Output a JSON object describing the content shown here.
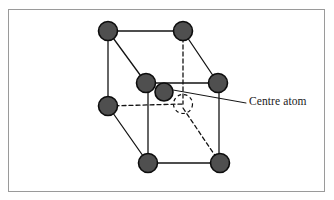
{
  "figure": {
    "frame": {
      "x": 8,
      "y": 9,
      "width": 317,
      "height": 183,
      "border_color": "#9a9a9a",
      "background": "#ffffff"
    },
    "colors": {
      "atom_fill": "#4f4f4f",
      "atom_stroke": "#0d0d0d",
      "edge_solid": "#141414",
      "edge_hidden": "#141414",
      "label_color": "#1a1a1a",
      "leader_color": "#141414"
    },
    "atoms": [
      {
        "id": "back-top-left",
        "name": "corner atom back top left",
        "cx": 108,
        "cy": 31,
        "r": 9.5,
        "style": "filled"
      },
      {
        "id": "back-top-right",
        "name": "corner atom back top right",
        "cx": 183,
        "cy": 31,
        "r": 9.5,
        "style": "filled"
      },
      {
        "id": "front-top-left",
        "name": "corner atom front top left",
        "cx": 146,
        "cy": 83,
        "r": 9.5,
        "style": "filled"
      },
      {
        "id": "front-top-right",
        "name": "corner atom front top right",
        "cx": 218,
        "cy": 83,
        "r": 9.5,
        "style": "filled"
      },
      {
        "id": "back-bottom-left",
        "name": "corner atom back bottom left",
        "cx": 108,
        "cy": 106,
        "r": 9.5,
        "style": "filled"
      },
      {
        "id": "front-bottom-left",
        "name": "corner atom front bottom left",
        "cx": 148,
        "cy": 163,
        "r": 9.5,
        "style": "filled"
      },
      {
        "id": "front-bottom-right",
        "name": "corner atom front bottom right",
        "cx": 220,
        "cy": 163,
        "r": 9.5,
        "style": "filled"
      },
      {
        "id": "centre",
        "name": "centre atom",
        "cx": 164,
        "cy": 92,
        "r": 9.0,
        "style": "filled"
      },
      {
        "id": "back-bottom-right",
        "name": "hidden corner atom back bottom right",
        "cx": 183,
        "cy": 104,
        "r": 9.5,
        "style": "dashed-outline"
      }
    ],
    "edges_solid": [
      {
        "name": "back-top-edge",
        "x1": 108,
        "y1": 31,
        "x2": 183,
        "y2": 31
      },
      {
        "name": "back-left-vertical",
        "x1": 108,
        "y1": 31,
        "x2": 108,
        "y2": 106
      },
      {
        "name": "back-top-left-to-front-top-left",
        "x1": 108,
        "y1": 31,
        "x2": 146,
        "y2": 83
      },
      {
        "name": "back-top-right-to-front-top-right",
        "x1": 183,
        "y1": 31,
        "x2": 218,
        "y2": 83
      },
      {
        "name": "front-top-edge",
        "x1": 146,
        "y1": 83,
        "x2": 218,
        "y2": 83
      },
      {
        "name": "front-left-vertical",
        "x1": 148,
        "y1": 83,
        "x2": 148,
        "y2": 163
      },
      {
        "name": "front-right-vertical",
        "x1": 219,
        "y1": 83,
        "x2": 219,
        "y2": 163
      },
      {
        "name": "front-bottom-edge",
        "x1": 148,
        "y1": 163,
        "x2": 220,
        "y2": 163
      },
      {
        "name": "back-bottom-left-to-front-bottom-left",
        "x1": 108,
        "y1": 106,
        "x2": 148,
        "y2": 163
      }
    ],
    "edges_hidden": [
      {
        "name": "back-right-vertical",
        "x1": 183,
        "y1": 31,
        "x2": 183,
        "y2": 104
      },
      {
        "name": "back-bottom-edge",
        "x1": 108,
        "y1": 106,
        "x2": 183,
        "y2": 104
      },
      {
        "name": "back-bottom-right-to-front-bottom-right",
        "x1": 183,
        "y1": 108,
        "x2": 220,
        "y2": 163
      }
    ],
    "leader_line": {
      "name": "centre-atom-leader",
      "x1": 173,
      "y1": 90,
      "x2": 246,
      "y2": 103
    },
    "label": {
      "name": "centre-atom-label",
      "text": "Centre atom",
      "x": 249,
      "y": 95
    }
  }
}
